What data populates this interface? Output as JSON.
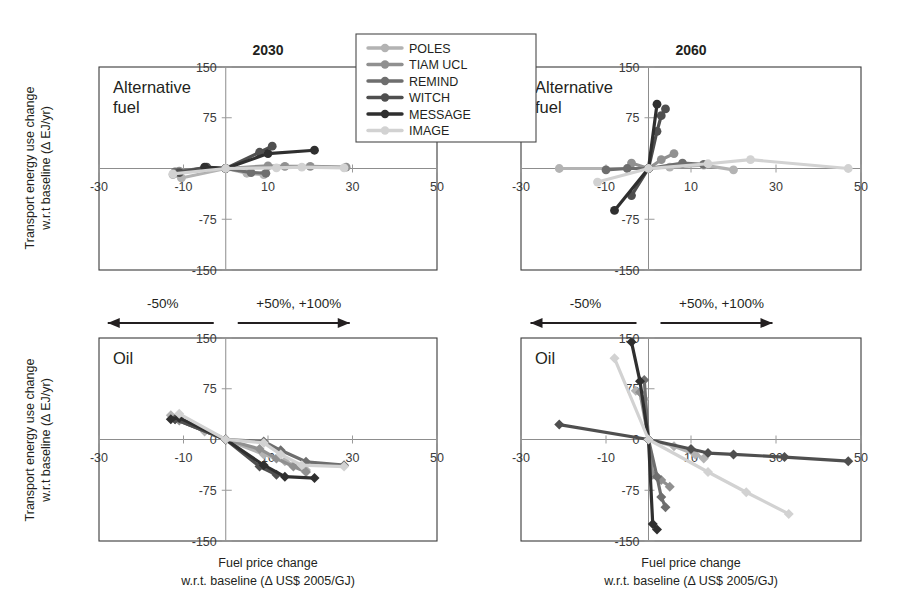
{
  "figure": {
    "y_axis_title_line1": "Transport energy use change",
    "y_axis_title_line2": "w.r.t baseline (Δ EJ/yr)",
    "x_axis_title_line1": "Fuel price change",
    "x_axis_title_line2": "w.r.t. baseline (Δ US$ 2005/GJ)",
    "annotation_left": "-50%",
    "annotation_right": "+50%, +100%"
  },
  "legend": {
    "position": "top-center",
    "entries": [
      {
        "label": "POLES",
        "color": "#b3b3b3"
      },
      {
        "label": "TIAM UCL",
        "color": "#909090"
      },
      {
        "label": "REMIND",
        "color": "#6e6e6e"
      },
      {
        "label": "WITCH",
        "color": "#4f4f4f"
      },
      {
        "label": "MESSAGE",
        "color": "#2f2f2f"
      },
      {
        "label": "IMAGE",
        "color": "#d2d2d2"
      }
    ]
  },
  "chart_data": [
    {
      "id": "alt-fuel-2030",
      "type": "line",
      "title": "2030",
      "tag": "Alternative fuel",
      "xlabel": "Fuel price change w.r.t. baseline (Δ US$ 2005/GJ)",
      "ylabel": "Transport energy use change w.r.t baseline (Δ EJ/yr)",
      "xlim": [
        -30,
        50
      ],
      "ylim": [
        -150,
        150
      ],
      "xticks": [
        -30,
        -10,
        10,
        30,
        50
      ],
      "yticks": [
        150,
        75,
        -75,
        -150
      ],
      "grid": false,
      "marker": "circle",
      "series": [
        {
          "name": "POLES",
          "color": "#b3b3b3",
          "points": [
            [
              -12.5,
              -9
            ],
            [
              -10.5,
              -14
            ],
            [
              0,
              0
            ],
            [
              5,
              -7
            ],
            [
              9,
              -9
            ]
          ]
        },
        {
          "name": "TIAM UCL",
          "color": "#909090",
          "points": [
            [
              -11,
              -4
            ],
            [
              0,
              0
            ],
            [
              10,
              4
            ],
            [
              14,
              3
            ],
            [
              20,
              3
            ],
            [
              28.5,
              2
            ]
          ]
        },
        {
          "name": "REMIND",
          "color": "#6e6e6e",
          "points": [
            [
              -12,
              -5
            ],
            [
              -5,
              1
            ],
            [
              0,
              0
            ],
            [
              6,
              -6
            ],
            [
              9.5,
              -7
            ]
          ]
        },
        {
          "name": "WITCH",
          "color": "#4f4f4f",
          "points": [
            [
              -11,
              -6
            ],
            [
              -4.5,
              2
            ],
            [
              0,
              0
            ],
            [
              8,
              24
            ],
            [
              11,
              33
            ]
          ]
        },
        {
          "name": "MESSAGE",
          "color": "#2f2f2f",
          "points": [
            [
              -5,
              2
            ],
            [
              0,
              0
            ],
            [
              10,
              22
            ],
            [
              21,
              27
            ]
          ]
        },
        {
          "name": "IMAGE",
          "color": "#d2d2d2",
          "points": [
            [
              -12.5,
              -8
            ],
            [
              0,
              0
            ],
            [
              12,
              1
            ],
            [
              18,
              2
            ],
            [
              28,
              1
            ]
          ]
        }
      ]
    },
    {
      "id": "alt-fuel-2060",
      "type": "line",
      "title": "2060",
      "tag": "Alternative fuel",
      "xlabel": "Fuel price change w.r.t. baseline (Δ US$ 2005/GJ)",
      "ylabel": "Transport energy use change w.r.t baseline (Δ EJ/yr)",
      "xlim": [
        -30,
        50
      ],
      "ylim": [
        -150,
        150
      ],
      "xticks": [
        -30,
        -10,
        10,
        30,
        50
      ],
      "yticks": [
        150,
        75,
        -75,
        -150
      ],
      "grid": false,
      "marker": "circle",
      "series": [
        {
          "name": "POLES",
          "color": "#b3b3b3",
          "points": [
            [
              -21,
              0
            ],
            [
              0,
              0
            ],
            [
              5,
              2
            ],
            [
              13,
              5
            ],
            [
              20,
              -2
            ]
          ]
        },
        {
          "name": "TIAM UCL",
          "color": "#909090",
          "points": [
            [
              -4,
              8
            ],
            [
              0,
              0
            ],
            [
              3,
              13
            ],
            [
              6,
              22
            ]
          ]
        },
        {
          "name": "REMIND",
          "color": "#6e6e6e",
          "points": [
            [
              -10,
              -2
            ],
            [
              -5,
              0
            ],
            [
              0,
              0
            ],
            [
              8,
              8
            ],
            [
              13,
              6
            ]
          ]
        },
        {
          "name": "WITCH",
          "color": "#4f4f4f",
          "points": [
            [
              -4,
              -40
            ],
            [
              0,
              0
            ],
            [
              2,
              55
            ],
            [
              3,
              78
            ],
            [
              4,
              88
            ]
          ]
        },
        {
          "name": "MESSAGE",
          "color": "#2f2f2f",
          "points": [
            [
              -8,
              -62
            ],
            [
              0,
              0
            ],
            [
              2,
              95
            ]
          ]
        },
        {
          "name": "IMAGE",
          "color": "#d2d2d2",
          "points": [
            [
              -12,
              -20
            ],
            [
              0,
              0
            ],
            [
              14,
              7
            ],
            [
              24,
              13
            ],
            [
              47,
              0
            ]
          ]
        }
      ]
    },
    {
      "id": "oil-2030",
      "type": "line",
      "title": "",
      "tag": "Oil",
      "xlabel": "Fuel price change w.r.t. baseline (Δ US$ 2005/GJ)",
      "ylabel": "Transport energy use change w.r.t baseline (Δ EJ/yr)",
      "xlim": [
        -30,
        50
      ],
      "ylim": [
        -150,
        150
      ],
      "xticks": [
        -30,
        -10,
        10,
        30,
        50
      ],
      "yticks": [
        150,
        75,
        0,
        -75,
        -150
      ],
      "grid": false,
      "marker": "diamond",
      "series": [
        {
          "name": "POLES",
          "color": "#b3b3b3",
          "points": [
            [
              -13,
              36
            ],
            [
              -5,
              12
            ],
            [
              0,
              0
            ],
            [
              9,
              -22
            ],
            [
              14,
              -32
            ],
            [
              19,
              -45
            ]
          ]
        },
        {
          "name": "TIAM UCL",
          "color": "#909090",
          "points": [
            [
              -11,
              28
            ],
            [
              0,
              0
            ],
            [
              8,
              -14
            ],
            [
              12,
              -28
            ],
            [
              16,
              -40
            ],
            [
              19,
              -48
            ]
          ]
        },
        {
          "name": "REMIND",
          "color": "#6e6e6e",
          "points": [
            [
              -12,
              30
            ],
            [
              0,
              0
            ],
            [
              9,
              -3
            ],
            [
              13,
              -16
            ],
            [
              19,
              -33
            ],
            [
              28,
              -38
            ]
          ]
        },
        {
          "name": "WITCH",
          "color": "#4f4f4f",
          "points": [
            [
              -12,
              30
            ],
            [
              0,
              0
            ],
            [
              8,
              -40
            ],
            [
              12,
              -52
            ]
          ]
        },
        {
          "name": "MESSAGE",
          "color": "#2f2f2f",
          "points": [
            [
              -13,
              30
            ],
            [
              -11,
              32
            ],
            [
              0,
              0
            ],
            [
              9,
              -38
            ],
            [
              14,
              -55
            ],
            [
              21,
              -57
            ]
          ]
        },
        {
          "name": "IMAGE",
          "color": "#d2d2d2",
          "points": [
            [
              -11,
              38
            ],
            [
              0,
              0
            ],
            [
              9,
              -5
            ],
            [
              13,
              -22
            ],
            [
              18,
              -38
            ],
            [
              28,
              -40
            ]
          ]
        }
      ]
    },
    {
      "id": "oil-2060",
      "type": "line",
      "title": "",
      "tag": "Oil",
      "xlabel": "Fuel price change w.r.t. baseline (Δ US$ 2005/GJ)",
      "ylabel": "Transport energy use change w.r.t baseline (Δ EJ/yr)",
      "xlim": [
        -30,
        50
      ],
      "ylim": [
        -150,
        150
      ],
      "xticks": [
        -30,
        -10,
        10,
        30,
        50
      ],
      "yticks": [
        150,
        75,
        0,
        -75,
        -150
      ],
      "grid": false,
      "marker": "diamond",
      "series": [
        {
          "name": "POLES",
          "color": "#b3b3b3",
          "points": [
            [
              -3,
              72
            ],
            [
              -1,
              60
            ],
            [
              0,
              0
            ],
            [
              6,
              -10
            ],
            [
              11,
              -22
            ],
            [
              13,
              -28
            ]
          ]
        },
        {
          "name": "TIAM UCL",
          "color": "#909090",
          "points": [
            [
              -2,
              70
            ],
            [
              0,
              0
            ],
            [
              1,
              -52
            ],
            [
              3,
              -60
            ],
            [
              5,
              -70
            ]
          ]
        },
        {
          "name": "REMIND",
          "color": "#6e6e6e",
          "points": [
            [
              -1,
              88
            ],
            [
              0,
              0
            ],
            [
              2,
              -55
            ],
            [
              3,
              -85
            ],
            [
              4,
              -100
            ]
          ]
        },
        {
          "name": "WITCH",
          "color": "#4f4f4f",
          "points": [
            [
              -21,
              22
            ],
            [
              0,
              0
            ],
            [
              10,
              -14
            ],
            [
              14,
              -20
            ],
            [
              20,
              -22
            ],
            [
              32,
              -26
            ],
            [
              47,
              -32
            ]
          ]
        },
        {
          "name": "MESSAGE",
          "color": "#2f2f2f",
          "points": [
            [
              -4,
              144
            ],
            [
              -2,
              86
            ],
            [
              0,
              0
            ],
            [
              1,
              -125
            ],
            [
              2,
              -133
            ]
          ]
        },
        {
          "name": "IMAGE",
          "color": "#d2d2d2",
          "points": [
            [
              -8,
              120
            ],
            [
              0,
              0
            ],
            [
              14,
              -48
            ],
            [
              23,
              -78
            ],
            [
              33,
              -110
            ]
          ]
        }
      ]
    }
  ]
}
